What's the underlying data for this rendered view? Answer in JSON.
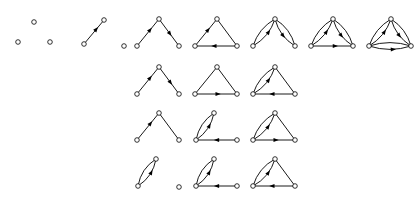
{
  "figure": {
    "type": "graph-grid",
    "width": 414,
    "height": 198,
    "background_color": "#ffffff",
    "ink_color": "#000000",
    "vertex_fill_color": "#ffffff",
    "vertex_radius": 2.3,
    "columns": 7,
    "rows": 4,
    "column_x": [
      14,
      72,
      130,
      188,
      246,
      304,
      362
    ],
    "row_y": [
      10,
      58,
      104,
      150
    ],
    "layout": {
      "apex": {
        "x": 29,
        "y": 10
      },
      "left": {
        "x": 9,
        "y": 38
      },
      "right": {
        "x": 49,
        "y": 38
      },
      "isolated_right": {
        "x": 53,
        "y": 38
      }
    },
    "cells": [
      {
        "id": "r1c1",
        "row": 0,
        "col": 0,
        "edge_count": 0,
        "label": "empty graph",
        "nodes": [
          {
            "name": "apex",
            "x": 20,
            "y": 12
          },
          {
            "name": "left",
            "x": 4,
            "y": 32
          },
          {
            "name": "right",
            "x": 36,
            "y": 32
          }
        ],
        "edges": []
      },
      {
        "id": "r1c2",
        "row": 0,
        "col": 1,
        "edge_count": 1,
        "label": "single edge",
        "nodes": [
          {
            "name": "apex",
            "x": 32,
            "y": 10
          },
          {
            "name": "left",
            "x": 12,
            "y": 34
          },
          {
            "name": "right",
            "x": 52,
            "y": 36
          }
        ],
        "edges": [
          {
            "from": "left",
            "to": "apex",
            "style": "straight",
            "arrow": true,
            "arrow_pos": 0.62
          }
        ]
      },
      {
        "id": "r1c3",
        "row": 0,
        "col": 2,
        "edge_count": 2,
        "label": "path",
        "nodes": [
          {
            "name": "apex",
            "x": 29,
            "y": 9
          },
          {
            "name": "left",
            "x": 7,
            "y": 36
          },
          {
            "name": "right",
            "x": 49,
            "y": 36
          }
        ],
        "edges": [
          {
            "from": "left",
            "to": "apex",
            "style": "straight",
            "arrow": true,
            "arrow_pos": 0.6
          },
          {
            "from": "apex",
            "to": "right",
            "style": "straight",
            "arrow": true,
            "arrow_pos": 0.55
          }
        ]
      },
      {
        "id": "r1c4",
        "row": 0,
        "col": 3,
        "edge_count": 3,
        "label": "triangle",
        "nodes": [
          {
            "name": "apex",
            "x": 29,
            "y": 9
          },
          {
            "name": "left",
            "x": 7,
            "y": 36
          },
          {
            "name": "right",
            "x": 49,
            "y": 36
          }
        ],
        "edges": [
          {
            "from": "left",
            "to": "apex",
            "style": "straight",
            "arrow": true,
            "arrow_pos": 0.6
          },
          {
            "from": "apex",
            "to": "right",
            "style": "straight",
            "arrow": false
          },
          {
            "from": "right",
            "to": "left",
            "style": "straight",
            "arrow": true,
            "arrow_pos": 0.55
          }
        ]
      },
      {
        "id": "r1c5",
        "row": 0,
        "col": 4,
        "edge_count": 4,
        "label": "doubled path",
        "nodes": [
          {
            "name": "apex",
            "x": 29,
            "y": 9
          },
          {
            "name": "left",
            "x": 7,
            "y": 36
          },
          {
            "name": "right",
            "x": 49,
            "y": 36
          }
        ],
        "edges": [
          {
            "from": "left",
            "to": "apex",
            "style": "curve",
            "bow": 3.4,
            "arrow": true,
            "arrow_pos": 0.6
          },
          {
            "from": "left",
            "to": "apex",
            "style": "curve",
            "bow": -3.4,
            "arrow": false
          },
          {
            "from": "apex",
            "to": "right",
            "style": "curve",
            "bow": 3.4,
            "arrow": true,
            "arrow_pos": 0.55
          },
          {
            "from": "apex",
            "to": "right",
            "style": "curve",
            "bow": -3.4,
            "arrow": false
          }
        ]
      },
      {
        "id": "r1c6",
        "row": 0,
        "col": 5,
        "edge_count": 5,
        "label": "triangle with two doubled edges",
        "nodes": [
          {
            "name": "apex",
            "x": 29,
            "y": 9
          },
          {
            "name": "left",
            "x": 7,
            "y": 36
          },
          {
            "name": "right",
            "x": 49,
            "y": 36
          }
        ],
        "edges": [
          {
            "from": "left",
            "to": "apex",
            "style": "curve",
            "bow": 3.2,
            "arrow": true,
            "arrow_pos": 0.6
          },
          {
            "from": "left",
            "to": "apex",
            "style": "curve",
            "bow": -3.2,
            "arrow": false
          },
          {
            "from": "apex",
            "to": "right",
            "style": "curve",
            "bow": 3.2,
            "arrow": true,
            "arrow_pos": 0.55
          },
          {
            "from": "apex",
            "to": "right",
            "style": "curve",
            "bow": -3.2,
            "arrow": false
          },
          {
            "from": "left",
            "to": "right",
            "style": "straight",
            "arrow": true,
            "arrow_pos": 0.58
          }
        ]
      },
      {
        "id": "r1c7",
        "row": 0,
        "col": 6,
        "edge_count": 6,
        "label": "fully doubled triangle",
        "nodes": [
          {
            "name": "apex",
            "x": 29,
            "y": 9
          },
          {
            "name": "left",
            "x": 7,
            "y": 36
          },
          {
            "name": "right",
            "x": 49,
            "y": 36
          }
        ],
        "edges": [
          {
            "from": "left",
            "to": "apex",
            "style": "curve",
            "bow": 3.2,
            "arrow": true,
            "arrow_pos": 0.6
          },
          {
            "from": "left",
            "to": "apex",
            "style": "curve",
            "bow": -3.2,
            "arrow": false
          },
          {
            "from": "apex",
            "to": "right",
            "style": "curve",
            "bow": 3.2,
            "arrow": true,
            "arrow_pos": 0.55
          },
          {
            "from": "apex",
            "to": "right",
            "style": "curve",
            "bow": -3.2,
            "arrow": false
          },
          {
            "from": "left",
            "to": "right",
            "style": "curve",
            "bow": 3.4,
            "arrow": true,
            "arrow_pos": 0.58
          },
          {
            "from": "left",
            "to": "right",
            "style": "curve",
            "bow": -3.4,
            "arrow": false
          }
        ]
      },
      {
        "id": "r2c3",
        "row": 1,
        "col": 2,
        "edge_count": 2,
        "label": "path variant",
        "nodes": [
          {
            "name": "apex",
            "x": 29,
            "y": 9
          },
          {
            "name": "left",
            "x": 7,
            "y": 36
          },
          {
            "name": "right",
            "x": 49,
            "y": 36
          }
        ],
        "edges": [
          {
            "from": "left",
            "to": "apex",
            "style": "straight",
            "arrow": true,
            "arrow_pos": 0.6
          },
          {
            "from": "apex",
            "to": "right",
            "style": "straight",
            "arrow": true,
            "arrow_pos": 0.58
          }
        ]
      },
      {
        "id": "r2c4",
        "row": 1,
        "col": 3,
        "edge_count": 3,
        "label": "triangle variant",
        "nodes": [
          {
            "name": "apex",
            "x": 29,
            "y": 9
          },
          {
            "name": "left",
            "x": 7,
            "y": 36
          },
          {
            "name": "right",
            "x": 49,
            "y": 36
          }
        ],
        "edges": [
          {
            "from": "left",
            "to": "apex",
            "style": "straight",
            "arrow": false
          },
          {
            "from": "apex",
            "to": "right",
            "style": "straight",
            "arrow": false
          },
          {
            "from": "left",
            "to": "right",
            "style": "straight",
            "arrow": true,
            "arrow_pos": 0.55
          }
        ]
      },
      {
        "id": "r2c5",
        "row": 1,
        "col": 4,
        "edge_count": 4,
        "label": "triangle with one doubled edge",
        "nodes": [
          {
            "name": "apex",
            "x": 29,
            "y": 9
          },
          {
            "name": "left",
            "x": 7,
            "y": 36
          },
          {
            "name": "right",
            "x": 49,
            "y": 36
          }
        ],
        "edges": [
          {
            "from": "left",
            "to": "apex",
            "style": "curve",
            "bow": 3.4,
            "arrow": true,
            "arrow_pos": 0.6
          },
          {
            "from": "left",
            "to": "apex",
            "style": "curve",
            "bow": -3.4,
            "arrow": false
          },
          {
            "from": "apex",
            "to": "right",
            "style": "straight",
            "arrow": false
          },
          {
            "from": "right",
            "to": "left",
            "style": "straight",
            "arrow": true,
            "arrow_pos": 0.55
          }
        ]
      },
      {
        "id": "r3c3",
        "row": 2,
        "col": 2,
        "edge_count": 2,
        "label": "path variant two",
        "nodes": [
          {
            "name": "apex",
            "x": 29,
            "y": 9
          },
          {
            "name": "left",
            "x": 7,
            "y": 36
          },
          {
            "name": "right",
            "x": 49,
            "y": 36
          }
        ],
        "edges": [
          {
            "from": "left",
            "to": "apex",
            "style": "straight",
            "arrow": true,
            "arrow_pos": 0.62
          },
          {
            "from": "apex",
            "to": "right",
            "style": "straight",
            "arrow": false
          }
        ]
      },
      {
        "id": "r3c4",
        "row": 2,
        "col": 3,
        "edge_count": 3,
        "label": "doubled edge plus pendant",
        "nodes": [
          {
            "name": "apex",
            "x": 26,
            "y": 9
          },
          {
            "name": "left",
            "x": 8,
            "y": 36
          },
          {
            "name": "right",
            "x": 49,
            "y": 36
          }
        ],
        "edges": [
          {
            "from": "left",
            "to": "apex",
            "style": "curve",
            "bow": 3.4,
            "arrow": true,
            "arrow_pos": 0.6
          },
          {
            "from": "left",
            "to": "apex",
            "style": "curve",
            "bow": -3.4,
            "arrow": false
          },
          {
            "from": "right",
            "to": "left",
            "style": "straight",
            "arrow": true,
            "arrow_pos": 0.5
          }
        ]
      },
      {
        "id": "r3c5",
        "row": 2,
        "col": 4,
        "edge_count": 4,
        "label": "triangle with doubled left edge",
        "nodes": [
          {
            "name": "apex",
            "x": 29,
            "y": 9
          },
          {
            "name": "left",
            "x": 7,
            "y": 36
          },
          {
            "name": "right",
            "x": 49,
            "y": 36
          }
        ],
        "edges": [
          {
            "from": "left",
            "to": "apex",
            "style": "curve",
            "bow": 3.4,
            "arrow": true,
            "arrow_pos": 0.58
          },
          {
            "from": "left",
            "to": "apex",
            "style": "curve",
            "bow": -3.4,
            "arrow": false
          },
          {
            "from": "apex",
            "to": "right",
            "style": "straight",
            "arrow": false
          },
          {
            "from": "left",
            "to": "right",
            "style": "straight",
            "arrow": true,
            "arrow_pos": 0.55
          }
        ]
      },
      {
        "id": "r4c3",
        "row": 3,
        "col": 2,
        "edge_count": 2,
        "label": "doubled edge with isolated vertex",
        "nodes": [
          {
            "name": "apex",
            "x": 26,
            "y": 9
          },
          {
            "name": "left",
            "x": 8,
            "y": 36
          },
          {
            "name": "right",
            "x": 49,
            "y": 37
          }
        ],
        "edges": [
          {
            "from": "left",
            "to": "apex",
            "style": "curve",
            "bow": 3.6,
            "arrow": true,
            "arrow_pos": 0.58
          },
          {
            "from": "left",
            "to": "apex",
            "style": "curve",
            "bow": -3.6,
            "arrow": false
          }
        ]
      },
      {
        "id": "r4c4",
        "row": 3,
        "col": 3,
        "edge_count": 3,
        "label": "doubled edge plus pendant variant",
        "nodes": [
          {
            "name": "apex",
            "x": 26,
            "y": 9
          },
          {
            "name": "left",
            "x": 8,
            "y": 36
          },
          {
            "name": "right",
            "x": 49,
            "y": 36
          }
        ],
        "edges": [
          {
            "from": "left",
            "to": "apex",
            "style": "curve",
            "bow": 3.6,
            "arrow": true,
            "arrow_pos": 0.58
          },
          {
            "from": "left",
            "to": "apex",
            "style": "curve",
            "bow": -3.6,
            "arrow": false
          },
          {
            "from": "right",
            "to": "left",
            "style": "straight",
            "arrow": true,
            "arrow_pos": 0.5
          }
        ]
      },
      {
        "id": "r4c5",
        "row": 3,
        "col": 4,
        "edge_count": 4,
        "label": "triangle with doubled left edge variant",
        "nodes": [
          {
            "name": "apex",
            "x": 29,
            "y": 9
          },
          {
            "name": "left",
            "x": 7,
            "y": 36
          },
          {
            "name": "right",
            "x": 49,
            "y": 36
          }
        ],
        "edges": [
          {
            "from": "left",
            "to": "apex",
            "style": "curve",
            "bow": 3.6,
            "arrow": true,
            "arrow_pos": 0.58
          },
          {
            "from": "left",
            "to": "apex",
            "style": "curve",
            "bow": -3.6,
            "arrow": false
          },
          {
            "from": "apex",
            "to": "right",
            "style": "straight",
            "arrow": false
          },
          {
            "from": "right",
            "to": "left",
            "style": "straight",
            "arrow": true,
            "arrow_pos": 0.55
          }
        ]
      }
    ]
  }
}
